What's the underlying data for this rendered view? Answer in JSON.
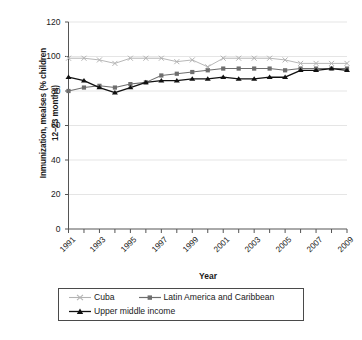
{
  "chart_data": {
    "type": "line",
    "title": "",
    "xlabel": "Year",
    "ylabel": "Inmunization, mealses (% children 12–23 months)",
    "ylabel_lines": [
      "Inmunization, mealses (% children",
      "12–23 months)"
    ],
    "ylim": [
      0,
      120
    ],
    "ytick_values": [
      0,
      20,
      40,
      60,
      80,
      100,
      120
    ],
    "ytick_labels": [
      "0",
      "20",
      "40",
      "60",
      "80",
      "100",
      "120"
    ],
    "xlim": [
      1991,
      2009
    ],
    "x": [
      1991,
      1992,
      1993,
      1994,
      1995,
      1996,
      1997,
      1998,
      1999,
      2000,
      2001,
      2002,
      2003,
      2004,
      2005,
      2006,
      2007,
      2008,
      2009
    ],
    "xtick_values": [
      1991,
      1992,
      1993,
      1994,
      1995,
      1996,
      1997,
      1998,
      1999,
      2000,
      2001,
      2002,
      2003,
      2004,
      2005,
      2006,
      2007,
      2008,
      2009
    ],
    "xtick_labels_shown": [
      "1991",
      "1993",
      "1995",
      "1997",
      "1999",
      "2001",
      "2003",
      "2005",
      "2007",
      "2009"
    ],
    "grid": "horizontal-light",
    "legend_position": "bottom",
    "series": [
      {
        "name": "Cuba",
        "color": "#b3b3b3",
        "marker": "x",
        "values": [
          99,
          99,
          98,
          96,
          99,
          99,
          99,
          97,
          98,
          94,
          99,
          99,
          99,
          99,
          98,
          96,
          96,
          96,
          96
        ]
      },
      {
        "name": "Latin America and Caribbean",
        "color": "#6e6e6e",
        "marker": "square",
        "values": [
          80,
          82,
          83,
          82,
          84,
          85,
          89,
          90,
          91,
          92,
          93,
          93,
          93,
          93,
          92,
          93,
          93,
          93,
          93
        ]
      },
      {
        "name": "Upper middle income",
        "color": "#111111",
        "marker": "triangle",
        "values": [
          88,
          86,
          82,
          79,
          82,
          85,
          86,
          86,
          87,
          87,
          88,
          87,
          87,
          88,
          88,
          92,
          92,
          93,
          92
        ]
      }
    ]
  },
  "legend": {
    "entries": [
      {
        "label": "Cuba"
      },
      {
        "label": "Latin America and Caribbean"
      },
      {
        "label": "Upper middle income"
      }
    ]
  }
}
